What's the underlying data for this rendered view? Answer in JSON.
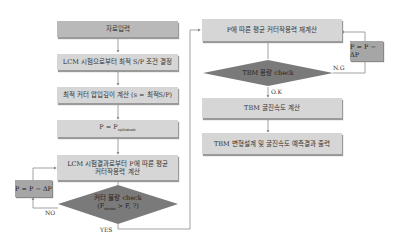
{
  "left_flow": {
    "step1": "자료입력",
    "step2": "LCM 시험으로부터 최적 S/P 조건 결정",
    "step3": "최적 커터 압입깊이 계산 (s = 최적S/P)",
    "step4_main": "P = P",
    "step4_sub": "optimum",
    "step5_line1": "LCM 시험결과로부터 P에 따른 평균",
    "step5_line2": "커터작용력 계산",
    "decision_line1": "커터 물량 check",
    "decision_line2": "(F",
    "decision_sub": "mean",
    "decision_line2_end": " > F, ?)",
    "loop_box": "P = P − ΔP",
    "no_label": "NO",
    "yes_label": "YES"
  },
  "right_flow": {
    "step1": "P에 따른 평균 커터작용력 재계산",
    "decision": "TBM 용량 check",
    "ok_label": "O.K",
    "ng_label": "N.G",
    "loop_box": "P = P − ΔP",
    "step2": "TBM 굴진속도 계산",
    "step3": "TBM 변형설계 및 굴진속도 예측결과 출력"
  },
  "colors": {
    "box_fill": "#d6d6d6",
    "input_fill": "#b9b9b9",
    "decision_fill": "#7a7a7a",
    "loop_fill": "#a6a6a6",
    "line": "#8a8a8a"
  }
}
